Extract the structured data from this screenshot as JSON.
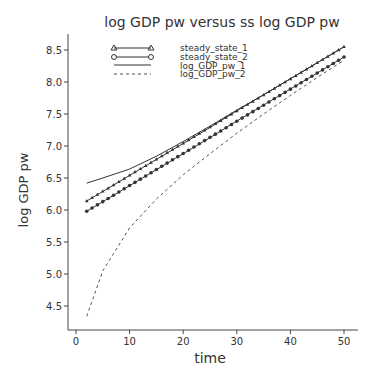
{
  "chart_data": {
    "type": "line",
    "title": "log GDP pw versus ss log GDP pw",
    "xlabel": "time",
    "ylabel": "log GDP pw",
    "xlim": [
      0,
      52
    ],
    "ylim": [
      4.2,
      8.7
    ],
    "xticks": [
      0,
      10,
      20,
      30,
      40,
      50
    ],
    "yticks": [
      4.5,
      5.0,
      5.5,
      6.0,
      6.5,
      7.0,
      7.5,
      8.0,
      8.5
    ],
    "ytick_labels": [
      "4.5",
      "5.0",
      "5.5",
      "6.0",
      "6.5",
      "7.0",
      "7.5",
      "8.0",
      "8.5"
    ],
    "grid": false,
    "legend_position": "upper-left",
    "x": [
      2,
      5,
      10,
      15,
      20,
      25,
      30,
      35,
      40,
      45,
      50
    ],
    "series": [
      {
        "name": "steady_state_1",
        "style": "line-triangle",
        "values": [
          6.14,
          6.29,
          6.54,
          6.79,
          7.04,
          7.29,
          7.55,
          7.8,
          8.05,
          8.3,
          8.55
        ]
      },
      {
        "name": "steady_state_2",
        "style": "line-circle",
        "values": [
          5.98,
          6.13,
          6.38,
          6.63,
          6.88,
          7.13,
          7.39,
          7.64,
          7.89,
          8.14,
          8.39
        ]
      },
      {
        "name": "log_GDP_pw_1",
        "style": "solid",
        "values": [
          6.42,
          6.5,
          6.64,
          6.84,
          7.07,
          7.31,
          7.56,
          7.8,
          8.05,
          8.3,
          8.55
        ]
      },
      {
        "name": "log_GDP_pw_2",
        "style": "dashed",
        "values": [
          4.34,
          5.05,
          5.72,
          6.17,
          6.55,
          6.88,
          7.2,
          7.5,
          7.79,
          8.07,
          8.34
        ]
      }
    ]
  },
  "legend": {
    "items": [
      "steady_state_1",
      "steady_state_2",
      "log_GDP_pw_1",
      "log_GDP_pw_2"
    ]
  }
}
